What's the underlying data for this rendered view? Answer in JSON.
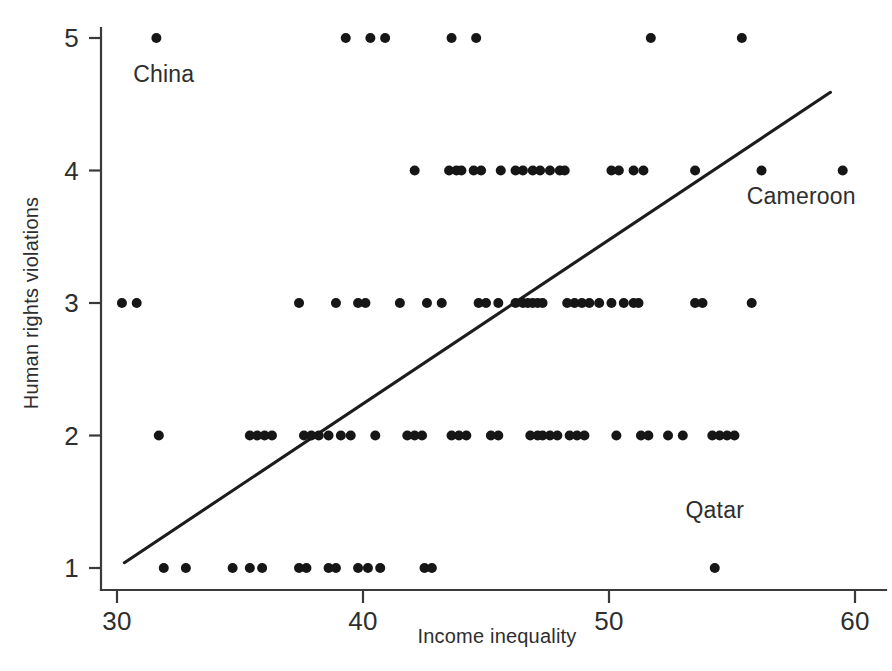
{
  "chart_data": {
    "type": "scatter",
    "title": "",
    "xlabel": "Income inequality",
    "ylabel": "Human rights violations",
    "xlim": [
      29.0,
      60.8
    ],
    "ylim": [
      0.62,
      5.28
    ],
    "xticks": [
      30,
      40,
      50,
      60
    ],
    "yticks": [
      1,
      2,
      3,
      4,
      5
    ],
    "xtick_labels": [
      "30",
      "40",
      "50",
      "60"
    ],
    "ytick_labels": [
      "1",
      "2",
      "3",
      "4",
      "5"
    ],
    "grid": false,
    "legend": "none",
    "marker": "filled-circle",
    "marker_color": "#161616",
    "marker_radius_px": 5.0,
    "axis_color": "#3a3a3a",
    "fit_line": {
      "type": "linear-regression",
      "color": "#1c1c1c",
      "x_start": 30.3,
      "y_start": 1.04,
      "x_end": 59.0,
      "y_end": 4.59
    },
    "annotations": [
      {
        "text": "China",
        "x": 31.9,
        "y": 4.67,
        "anchor": "middle"
      },
      {
        "text": "Cameroon",
        "x": 55.6,
        "y": 3.75,
        "anchor": "start"
      },
      {
        "text": "Qatar",
        "x": 54.3,
        "y": 1.38,
        "anchor": "middle"
      }
    ],
    "points": [
      {
        "x": 31.6,
        "y": 5
      },
      {
        "x": 39.3,
        "y": 5
      },
      {
        "x": 40.3,
        "y": 5
      },
      {
        "x": 40.9,
        "y": 5
      },
      {
        "x": 43.6,
        "y": 5
      },
      {
        "x": 44.6,
        "y": 5
      },
      {
        "x": 51.7,
        "y": 5
      },
      {
        "x": 55.4,
        "y": 5
      },
      {
        "x": 42.1,
        "y": 4
      },
      {
        "x": 43.5,
        "y": 4
      },
      {
        "x": 43.8,
        "y": 4
      },
      {
        "x": 44.0,
        "y": 4
      },
      {
        "x": 44.5,
        "y": 4
      },
      {
        "x": 44.8,
        "y": 4
      },
      {
        "x": 45.6,
        "y": 4
      },
      {
        "x": 46.2,
        "y": 4
      },
      {
        "x": 46.5,
        "y": 4
      },
      {
        "x": 46.9,
        "y": 4
      },
      {
        "x": 47.2,
        "y": 4
      },
      {
        "x": 47.6,
        "y": 4
      },
      {
        "x": 48.0,
        "y": 4
      },
      {
        "x": 48.2,
        "y": 4
      },
      {
        "x": 50.1,
        "y": 4
      },
      {
        "x": 50.4,
        "y": 4
      },
      {
        "x": 51.0,
        "y": 4
      },
      {
        "x": 51.4,
        "y": 4
      },
      {
        "x": 53.5,
        "y": 4
      },
      {
        "x": 56.2,
        "y": 4
      },
      {
        "x": 59.5,
        "y": 4
      },
      {
        "x": 30.2,
        "y": 3
      },
      {
        "x": 30.8,
        "y": 3
      },
      {
        "x": 37.4,
        "y": 3
      },
      {
        "x": 38.9,
        "y": 3
      },
      {
        "x": 39.8,
        "y": 3
      },
      {
        "x": 40.1,
        "y": 3
      },
      {
        "x": 41.5,
        "y": 3
      },
      {
        "x": 42.6,
        "y": 3
      },
      {
        "x": 43.2,
        "y": 3
      },
      {
        "x": 44.7,
        "y": 3
      },
      {
        "x": 45.0,
        "y": 3
      },
      {
        "x": 45.5,
        "y": 3
      },
      {
        "x": 46.2,
        "y": 3
      },
      {
        "x": 46.5,
        "y": 3
      },
      {
        "x": 46.7,
        "y": 3
      },
      {
        "x": 46.9,
        "y": 3
      },
      {
        "x": 47.1,
        "y": 3
      },
      {
        "x": 47.3,
        "y": 3
      },
      {
        "x": 48.3,
        "y": 3
      },
      {
        "x": 48.6,
        "y": 3
      },
      {
        "x": 48.9,
        "y": 3
      },
      {
        "x": 49.2,
        "y": 3
      },
      {
        "x": 49.6,
        "y": 3
      },
      {
        "x": 50.1,
        "y": 3
      },
      {
        "x": 50.6,
        "y": 3
      },
      {
        "x": 51.0,
        "y": 3
      },
      {
        "x": 51.2,
        "y": 3
      },
      {
        "x": 53.5,
        "y": 3
      },
      {
        "x": 53.8,
        "y": 3
      },
      {
        "x": 55.8,
        "y": 3
      },
      {
        "x": 31.7,
        "y": 2
      },
      {
        "x": 35.4,
        "y": 2
      },
      {
        "x": 35.7,
        "y": 2
      },
      {
        "x": 36.0,
        "y": 2
      },
      {
        "x": 36.3,
        "y": 2
      },
      {
        "x": 37.6,
        "y": 2
      },
      {
        "x": 37.9,
        "y": 2
      },
      {
        "x": 38.2,
        "y": 2
      },
      {
        "x": 38.6,
        "y": 2
      },
      {
        "x": 39.1,
        "y": 2
      },
      {
        "x": 39.5,
        "y": 2
      },
      {
        "x": 40.5,
        "y": 2
      },
      {
        "x": 41.8,
        "y": 2
      },
      {
        "x": 42.1,
        "y": 2
      },
      {
        "x": 42.4,
        "y": 2
      },
      {
        "x": 43.6,
        "y": 2
      },
      {
        "x": 43.9,
        "y": 2
      },
      {
        "x": 44.2,
        "y": 2
      },
      {
        "x": 45.2,
        "y": 2
      },
      {
        "x": 45.5,
        "y": 2
      },
      {
        "x": 46.8,
        "y": 2
      },
      {
        "x": 47.1,
        "y": 2
      },
      {
        "x": 47.3,
        "y": 2
      },
      {
        "x": 47.6,
        "y": 2
      },
      {
        "x": 47.9,
        "y": 2
      },
      {
        "x": 48.4,
        "y": 2
      },
      {
        "x": 48.7,
        "y": 2
      },
      {
        "x": 49.0,
        "y": 2
      },
      {
        "x": 50.3,
        "y": 2
      },
      {
        "x": 51.3,
        "y": 2
      },
      {
        "x": 51.6,
        "y": 2
      },
      {
        "x": 52.4,
        "y": 2
      },
      {
        "x": 53.0,
        "y": 2
      },
      {
        "x": 54.2,
        "y": 2
      },
      {
        "x": 54.5,
        "y": 2
      },
      {
        "x": 54.8,
        "y": 2
      },
      {
        "x": 55.1,
        "y": 2
      },
      {
        "x": 31.9,
        "y": 1
      },
      {
        "x": 32.8,
        "y": 1
      },
      {
        "x": 34.7,
        "y": 1
      },
      {
        "x": 35.4,
        "y": 1
      },
      {
        "x": 35.9,
        "y": 1
      },
      {
        "x": 37.4,
        "y": 1
      },
      {
        "x": 37.7,
        "y": 1
      },
      {
        "x": 38.6,
        "y": 1
      },
      {
        "x": 38.9,
        "y": 1
      },
      {
        "x": 39.8,
        "y": 1
      },
      {
        "x": 40.2,
        "y": 1
      },
      {
        "x": 40.7,
        "y": 1
      },
      {
        "x": 42.5,
        "y": 1
      },
      {
        "x": 42.8,
        "y": 1
      },
      {
        "x": 54.3,
        "y": 1
      }
    ]
  },
  "axes": {
    "x_title": "Income inequality",
    "y_title": "Human rights violations"
  },
  "caption": {
    "partial_text": ""
  }
}
